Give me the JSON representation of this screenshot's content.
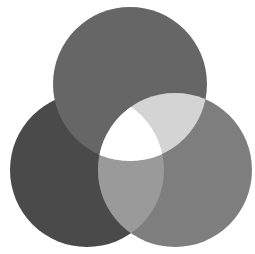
{
  "diagram": {
    "type": "three-circle-venn",
    "canvas": {
      "width": 255,
      "height": 254,
      "background": "#ffffff"
    },
    "circles": [
      {
        "id": "left",
        "cx": 87,
        "cy": 170,
        "r": 77,
        "fill": "#4a4a4a"
      },
      {
        "id": "top",
        "cx": 130,
        "cy": 84,
        "r": 77,
        "fill": "#666666"
      },
      {
        "id": "right",
        "cx": 175,
        "cy": 170,
        "r": 77,
        "fill": "#7e7e7e"
      }
    ],
    "intersections": {
      "top_right": "#d4d4d4",
      "left_right": "#9a9a9a",
      "all_three": "#ffffff"
    }
  }
}
